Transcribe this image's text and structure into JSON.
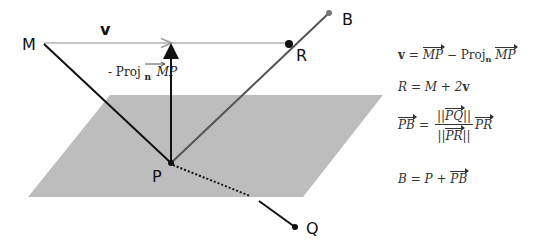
{
  "diagram": {
    "points": {
      "M": {
        "label": "M",
        "x": 42,
        "y": 43
      },
      "P": {
        "label": "P",
        "x": 171,
        "y": 163
      },
      "R": {
        "label": "R",
        "x": 289,
        "y": 44
      },
      "B": {
        "label": "B",
        "x": 329,
        "y": 13
      },
      "Q": {
        "label": "Q",
        "x": 295,
        "y": 227
      }
    },
    "vector_label": "v",
    "projection_label_prefix": "- Proj",
    "projection_label_sub": "n",
    "projection_label_vec": "MP",
    "plane": {
      "color": "#bdbdbd",
      "corners": [
        [
          110,
          95
        ],
        [
          383,
          95
        ],
        [
          303,
          197
        ],
        [
          28,
          197
        ]
      ]
    },
    "colors": {
      "line_dark": "#111111",
      "line_gray": "#555555",
      "vector_light": "#b0b0b0"
    }
  },
  "equations": [
    {
      "id": "eq-v",
      "lhs": "v",
      "rhs_vec1": "MP",
      "minus": "−",
      "proj": "Proj",
      "proj_sub": "n",
      "rhs_vec2": "MP"
    },
    {
      "id": "eq-r",
      "text_lhs": "R",
      "text_rhs": "M + 2",
      "bold_v": "v"
    },
    {
      "id": "eq-pb",
      "lhs_vec": "PB",
      "num_vec": "PQ",
      "den_vec": "PR",
      "rhs_vec": "PR",
      "norm": "||"
    },
    {
      "id": "eq-b",
      "text_lhs": "B",
      "text_mid": "P +",
      "rhs_vec": "PB"
    }
  ],
  "symbols": {
    "equals": "="
  }
}
